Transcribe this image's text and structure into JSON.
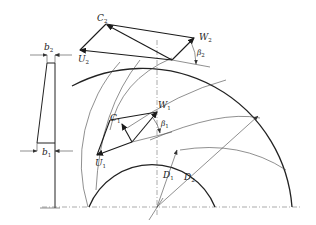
{
  "diagram": {
    "labels": {
      "b2": {
        "main": "b",
        "sub": "2"
      },
      "b1": {
        "main": "b",
        "sub": "1"
      },
      "C2": {
        "main": "C",
        "sub": "2"
      },
      "U2": {
        "main": "U",
        "sub": "2"
      },
      "W2": {
        "main": "W",
        "sub": "2"
      },
      "beta2": {
        "main": "β",
        "sub": "2"
      },
      "C1": {
        "main": "C",
        "sub": "1"
      },
      "W1": {
        "main": "W",
        "sub": "1"
      },
      "U1": {
        "main": "U",
        "sub": "1"
      },
      "beta1": {
        "main": "β",
        "sub": "1"
      },
      "D1": {
        "main": "D",
        "sub": "1"
      },
      "D2": {
        "main": "D",
        "sub": "2"
      }
    },
    "colors": {
      "line": "#222222",
      "background": "#ffffff"
    }
  }
}
